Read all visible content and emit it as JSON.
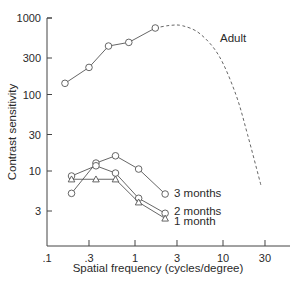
{
  "chart_data": {
    "type": "line",
    "title": "",
    "xlabel": "Spatial frequency (cycles/degree)",
    "ylabel": "Contrast sensitivity",
    "xscale": "log",
    "yscale": "log",
    "xlim": [
      0.1,
      40
    ],
    "ylim": [
      1,
      1000
    ],
    "x_ticks": [
      {
        "value": 0.1,
        "label": ".1"
      },
      {
        "value": 0.3,
        "label": ".3"
      },
      {
        "value": 1,
        "label": "1"
      },
      {
        "value": 3,
        "label": "3"
      },
      {
        "value": 10,
        "label": "10"
      },
      {
        "value": 30,
        "label": "30"
      }
    ],
    "y_ticks": [
      {
        "value": 3,
        "label": "3"
      },
      {
        "value": 10,
        "label": "10"
      },
      {
        "value": 30,
        "label": "30"
      },
      {
        "value": 100,
        "label": "100"
      },
      {
        "value": 300,
        "label": "300"
      },
      {
        "value": 1000,
        "label": "1000"
      }
    ],
    "grid": false,
    "legend": "inline labels at line ends",
    "series": [
      {
        "name": "Adult",
        "marker": "circle",
        "x": [
          0.16,
          0.3,
          0.5,
          0.85,
          1.7
        ],
        "y": [
          140,
          226,
          430,
          480,
          740
        ],
        "extrapolation": {
          "style": "dashed",
          "x": [
            1.7,
            2.5,
            3.5,
            5.5,
            9,
            14,
            19,
            27
          ],
          "y": [
            740,
            800,
            790,
            620,
            320,
            100,
            30,
            6.5
          ]
        },
        "label_pos": {
          "x": 220,
          "y": 42
        }
      },
      {
        "name": "3 months",
        "marker": "circle",
        "x": [
          0.19,
          0.36,
          0.6,
          1.1,
          2.2
        ],
        "y": [
          5.1,
          12.7,
          15.8,
          10.6,
          5.0
        ],
        "label_pos": {
          "x": 174,
          "y": 197
        }
      },
      {
        "name": "2 months",
        "marker": "circle",
        "x": [
          0.19,
          0.36,
          0.6,
          1.1,
          2.2
        ],
        "y": [
          8.6,
          11.7,
          9.4,
          4.4,
          2.8
        ],
        "label_pos": {
          "x": 174,
          "y": 215
        }
      },
      {
        "name": "1 month",
        "marker": "triangle",
        "x": [
          0.19,
          0.36,
          0.6,
          1.1,
          2.2
        ],
        "y": [
          7.8,
          7.8,
          7.8,
          3.9,
          2.4
        ],
        "label_pos": {
          "x": 174,
          "y": 225
        }
      }
    ],
    "colors": {
      "line": "#555555",
      "text": "#2a2a2a",
      "axis": "#444444"
    }
  }
}
